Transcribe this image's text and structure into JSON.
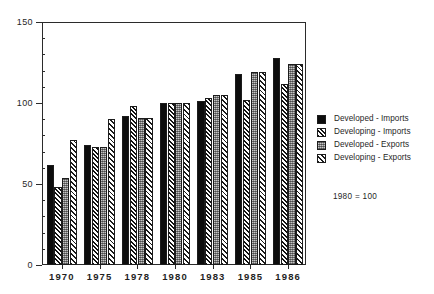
{
  "chart_data": {
    "type": "bar",
    "title": "",
    "subtitle": "",
    "xlabel": "",
    "ylabel": "",
    "categories": [
      "1970",
      "1975",
      "1978",
      "1980",
      "1983",
      "1985",
      "1986"
    ],
    "series": [
      {
        "name": "Developed - Imports",
        "pattern": "solid-black",
        "values": [
          62,
          74,
          92,
          100,
          101,
          118,
          128
        ]
      },
      {
        "name": "Developing - Imports",
        "pattern": "hatch-dark",
        "values": [
          48,
          73,
          98,
          100,
          103,
          102,
          112
        ]
      },
      {
        "name": "Developed - Exports",
        "pattern": "gray-check",
        "values": [
          54,
          73,
          91,
          100,
          105,
          119,
          124
        ]
      },
      {
        "name": "Developing - Exports",
        "pattern": "hatch-light",
        "values": [
          77,
          90,
          91,
          100,
          105,
          119,
          124
        ]
      }
    ],
    "ylim": [
      0,
      150
    ],
    "y_major_ticks": [
      0,
      50,
      100,
      150
    ],
    "y_minor_tick_interval": 10,
    "grid": false,
    "legend_position": "right",
    "annotations": [
      "1980 = 100"
    ]
  },
  "legend": {
    "items": [
      {
        "label": "Developed - Imports"
      },
      {
        "label": "Developing - Imports"
      },
      {
        "label": "Developed - Exports"
      },
      {
        "label": "Developing - Exports"
      }
    ]
  },
  "annotation": {
    "base_year_note": "1980 = 100"
  },
  "axis": {
    "y_labels": [
      "150",
      "100",
      "50",
      "0"
    ],
    "x_labels": [
      "1970",
      "1975",
      "1978",
      "1980",
      "1983",
      "1985",
      "1986"
    ]
  },
  "artifacts": {
    "top_text": ""
  }
}
